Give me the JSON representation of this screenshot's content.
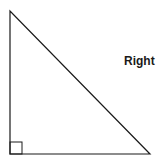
{
  "diagram": {
    "type": "right-triangle",
    "label": "Right",
    "stroke_color": "#1a1a1a",
    "vertices": [
      [
        10,
        11
      ],
      [
        10,
        154
      ],
      [
        150,
        154
      ]
    ],
    "right_angle_marker": {
      "x": 10,
      "y": 142,
      "size": 12
    }
  }
}
